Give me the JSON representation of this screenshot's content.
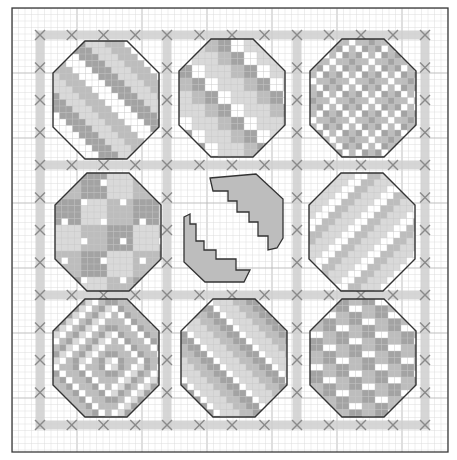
{
  "pattern": {
    "title": "Cross-stitch Easter egg sampler chart",
    "canvas": {
      "width": 457,
      "height": 460
    },
    "frame": {
      "x": 12,
      "y": 8,
      "width": 436,
      "height": 444,
      "color": "#3a3a3a"
    },
    "grid": {
      "cell": 6.5,
      "origin_x": 12,
      "origin_y": 8,
      "minor_color": "#dcdcdc",
      "major_every": 10,
      "major_color": "#b8b8b8"
    },
    "band": {
      "color": "#cfcfcf",
      "width": 9,
      "horizontal_y": [
        35,
        165,
        295,
        425
      ],
      "vertical_x": [
        40,
        167,
        297,
        425
      ],
      "span_start": 36,
      "span_end": 429
    },
    "x_marks": {
      "color": "#8a8a8a",
      "size": 5,
      "spacing": 32.5
    },
    "colors": {
      "outline": "#333333",
      "light": "#d9d9d9",
      "mid": "#bdbdbd",
      "dark": "#a3a3a3",
      "white": "#ffffff"
    },
    "eggs": [
      {
        "id": "egg-1",
        "row": 0,
        "col": 0,
        "cx": 106,
        "cy": 100,
        "motif": "diagonal-zigzag"
      },
      {
        "id": "egg-2",
        "row": 0,
        "col": 1,
        "cx": 232,
        "cy": 98,
        "motif": "checker-squares"
      },
      {
        "id": "egg-3",
        "row": 0,
        "col": 2,
        "cx": 363,
        "cy": 98,
        "motif": "diagonal-crosses"
      },
      {
        "id": "egg-4",
        "row": 1,
        "col": 0,
        "cx": 108,
        "cy": 232,
        "motif": "polka-dots"
      },
      {
        "id": "egg-5",
        "row": 1,
        "col": 1,
        "cx": 232,
        "cy": 232,
        "motif": "cracked-shell"
      },
      {
        "id": "egg-6",
        "row": 1,
        "col": 2,
        "cx": 362,
        "cy": 232,
        "motif": "diagonal-stripes"
      },
      {
        "id": "egg-7",
        "row": 2,
        "col": 0,
        "cx": 106,
        "cy": 358,
        "motif": "diamond-lattice"
      },
      {
        "id": "egg-8",
        "row": 2,
        "col": 1,
        "cx": 234,
        "cy": 358,
        "motif": "arrow-chevrons"
      },
      {
        "id": "egg-9",
        "row": 2,
        "col": 2,
        "cx": 363,
        "cy": 358,
        "motif": "wavy-stripes"
      }
    ]
  }
}
